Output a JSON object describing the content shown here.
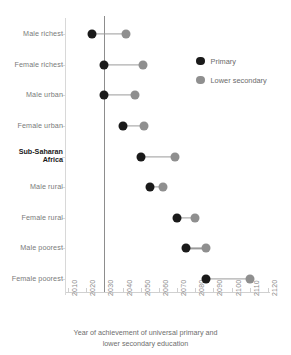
{
  "chart_data": {
    "type": "scatter",
    "subtype": "dumbbell",
    "title": "",
    "xlabel_lines": [
      "Year of achievement of universal primary and",
      "lower secondary education"
    ],
    "ylabel": "",
    "xlim": [
      2010,
      2120
    ],
    "xticks": [
      2010,
      2020,
      2030,
      2040,
      2050,
      2060,
      2070,
      2080,
      2090,
      2100,
      2110,
      2120
    ],
    "xtick_labels": [
      "2010",
      "2020",
      "2030",
      "2040",
      "2050",
      "2060",
      "2070",
      "2080",
      "2090",
      "2100",
      "2110",
      "2120"
    ],
    "grid": false,
    "legend_position": "upper right",
    "reference_line": 2030,
    "categories": [
      "Male richest",
      "Female richest",
      "Male urban",
      "Female urban",
      "Sub-Saharan Africa",
      "Male rural",
      "Female rural",
      "Male poorest",
      "Female poorest"
    ],
    "highlight_category": "Sub-Saharan Africa",
    "highlight_label_lines": [
      "Sub-Saharan",
      "Africa"
    ],
    "series": [
      {
        "name": "Primary",
        "color": "#1a1a1a",
        "values": [
          2023,
          2030,
          2030,
          2040,
          2050,
          2055,
          2070,
          2075,
          2086
        ]
      },
      {
        "name": "Lower secondary",
        "color": "#8f8f8f",
        "values": [
          2042,
          2051,
          2047,
          2052,
          2069,
          2062,
          2080,
          2086,
          2110
        ]
      }
    ]
  },
  "legend": {
    "items": [
      {
        "label": "Primary",
        "swatch": "primary-dot-icon"
      },
      {
        "label": "Lower secondary",
        "swatch": "lower-secondary-dot-icon"
      }
    ]
  }
}
